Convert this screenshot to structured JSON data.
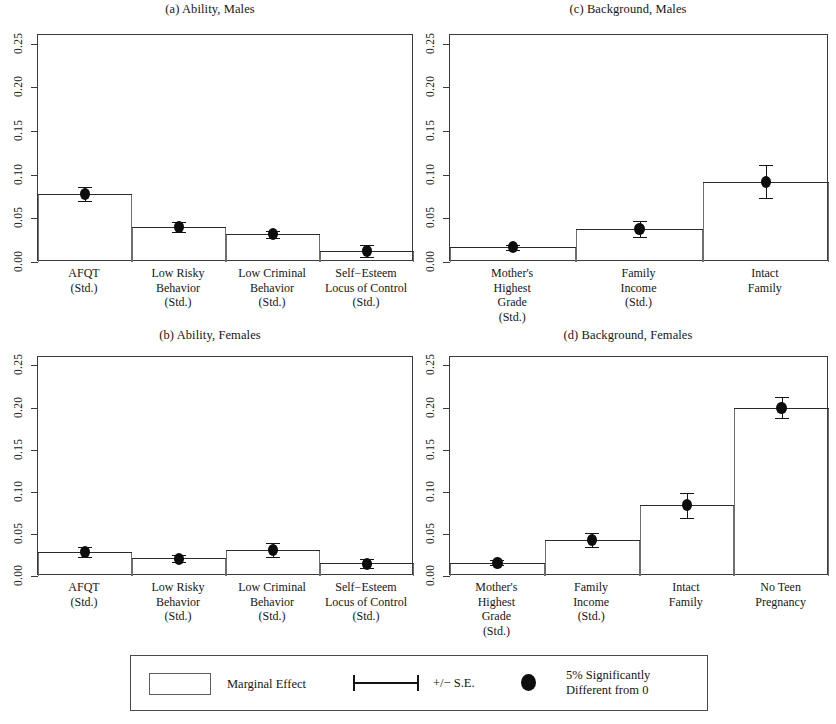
{
  "figure": {
    "background": "#ffffff",
    "line_color": "#2b2b2b",
    "marker_color": "#0d0d0d"
  },
  "legend": {
    "marginal_effect_label": "Marginal Effect",
    "se_label": "+/− S.E.",
    "significance_label": "5% Significantly\nDifferent from 0"
  },
  "chart_data": [
    {
      "type": "bar",
      "panel_id": "a",
      "title": "(a) Ability, Males",
      "categories": [
        "AFQT\n(Std.)",
        "Low Risky\nBehavior\n(Std.)",
        "Low Criminal\nBehavior\n(Std.)",
        "Self−Esteem\nLocus of Control\n(Std.)"
      ],
      "values": [
        0.078,
        0.04,
        0.032,
        0.013
      ],
      "errors": [
        0.008,
        0.006,
        0.004,
        0.007
      ],
      "significant": [
        true,
        true,
        true,
        true
      ],
      "xlabel": "",
      "ylabel": "",
      "ylim": [
        0,
        0.26
      ],
      "yticks": [
        0.0,
        0.05,
        0.1,
        0.15,
        0.2,
        0.25
      ],
      "ytick_labels": [
        "0.00",
        "0.05",
        "0.10",
        "0.15",
        "0.20",
        "0.25"
      ],
      "grid": false,
      "legend_position": "below-figure"
    },
    {
      "type": "bar",
      "panel_id": "b",
      "title": "(b) Ability, Females",
      "categories": [
        "AFQT\n(Std.)",
        "Low Risky\nBehavior\n(Std.)",
        "Low Criminal\nBehavior\n(Std.)",
        "Self−Esteem\nLocus of Control\n(Std.)"
      ],
      "values": [
        0.029,
        0.021,
        0.031,
        0.015
      ],
      "errors": [
        0.006,
        0.004,
        0.008,
        0.005
      ],
      "significant": [
        true,
        true,
        true,
        true
      ],
      "xlabel": "",
      "ylabel": "",
      "ylim": [
        0,
        0.26
      ],
      "yticks": [
        0.0,
        0.05,
        0.1,
        0.15,
        0.2,
        0.25
      ],
      "ytick_labels": [
        "0.00",
        "0.05",
        "0.10",
        "0.15",
        "0.20",
        "0.25"
      ],
      "grid": false,
      "legend_position": "below-figure"
    },
    {
      "type": "bar",
      "panel_id": "c",
      "title": "(c) Background, Males",
      "categories": [
        "Mother's\nHighest\nGrade\n(Std.)",
        "Family\nIncome\n(Std.)",
        "Intact\nFamily"
      ],
      "values": [
        0.017,
        0.038,
        0.092
      ],
      "errors": [
        0.003,
        0.009,
        0.019
      ],
      "significant": [
        true,
        true,
        true
      ],
      "xlabel": "",
      "ylabel": "",
      "ylim": [
        0,
        0.26
      ],
      "yticks": [
        0.0,
        0.05,
        0.1,
        0.15,
        0.2,
        0.25
      ],
      "ytick_labels": [
        "0.00",
        "0.05",
        "0.10",
        "0.15",
        "0.20",
        "0.25"
      ],
      "grid": false,
      "legend_position": "below-figure"
    },
    {
      "type": "bar",
      "panel_id": "d",
      "title": "(d) Background, Females",
      "categories": [
        "Mother's\nHighest\nGrade\n(Std.)",
        "Family\nIncome\n(Std.)",
        "Intact\nFamily",
        "No Teen\nPregnancy"
      ],
      "values": [
        0.016,
        0.043,
        0.084,
        0.2
      ],
      "errors": [
        0.003,
        0.008,
        0.015,
        0.012
      ],
      "significant": [
        true,
        true,
        true,
        true
      ],
      "xlabel": "",
      "ylabel": "",
      "ylim": [
        0,
        0.26
      ],
      "yticks": [
        0.0,
        0.05,
        0.1,
        0.15,
        0.2,
        0.25
      ],
      "ytick_labels": [
        "0.00",
        "0.05",
        "0.10",
        "0.15",
        "0.20",
        "0.25"
      ],
      "grid": false,
      "legend_position": "below-figure"
    }
  ]
}
